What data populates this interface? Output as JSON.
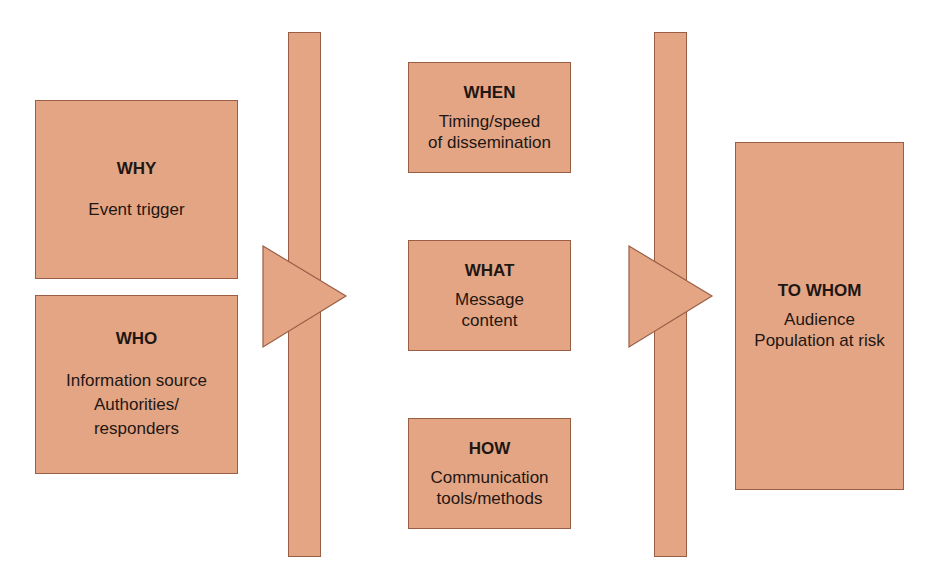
{
  "diagram": {
    "colors": {
      "fill": "#e4a585",
      "stroke": "#9a5e45",
      "text": "#1e1712"
    },
    "sources": [
      {
        "id": "why",
        "title": "WHY",
        "description": "Event trigger"
      },
      {
        "id": "who",
        "title": "WHO",
        "description": "Information source\nAuthorities/\nresponders"
      }
    ],
    "message": [
      {
        "id": "when",
        "title": "WHEN",
        "description": "Timing/speed\nof dissemination"
      },
      {
        "id": "what",
        "title": "WHAT",
        "description": "Message\ncontent"
      },
      {
        "id": "how",
        "title": "HOW",
        "description": "Communication\ntools/methods"
      }
    ],
    "target": {
      "id": "to-whom",
      "title": "TO WHOM",
      "description": "Audience\nPopulation at risk"
    },
    "connectors": [
      {
        "id": "arrow-1",
        "from": "sources",
        "to": "message",
        "shape": "bar-with-triangle"
      },
      {
        "id": "arrow-2",
        "from": "message",
        "to": "target",
        "shape": "bar-with-triangle"
      }
    ]
  }
}
